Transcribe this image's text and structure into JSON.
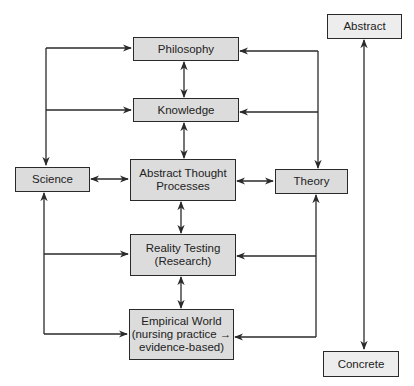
{
  "colors": {
    "box_fill": "#dcdcdc",
    "box_fill_light": "#ededed",
    "border": "#2a2a2a",
    "line": "#2a2a2a"
  },
  "nodes": {
    "philosophy": {
      "label": "Philosophy"
    },
    "knowledge": {
      "label": "Knowledge"
    },
    "abstract_thought": {
      "line1": "Abstract Thought",
      "line2": "Processes"
    },
    "reality_testing": {
      "line1": "Reality Testing",
      "line2": "(Research)"
    },
    "empirical_world": {
      "line1": "Empirical World",
      "line2": "(nursing practice →",
      "line3": "evidence-based)"
    },
    "science": {
      "label": "Science"
    },
    "theory": {
      "label": "Theory"
    },
    "abstract": {
      "label": "Abstract"
    },
    "concrete": {
      "label": "Concrete"
    }
  },
  "edges": [
    {
      "from": "philosophy",
      "to": "knowledge",
      "type": "bidirectional"
    },
    {
      "from": "knowledge",
      "to": "abstract_thought",
      "type": "bidirectional"
    },
    {
      "from": "abstract_thought",
      "to": "reality_testing",
      "type": "bidirectional"
    },
    {
      "from": "reality_testing",
      "to": "empirical_world",
      "type": "bidirectional"
    },
    {
      "from": "science",
      "to": "abstract_thought",
      "type": "bidirectional"
    },
    {
      "from": "abstract_thought",
      "to": "theory",
      "type": "bidirectional"
    },
    {
      "from": "science",
      "to": [
        "philosophy",
        "knowledge",
        "reality_testing",
        "empirical_world"
      ],
      "type": "bus"
    },
    {
      "from": "theory",
      "to": [
        "philosophy",
        "knowledge",
        "reality_testing",
        "empirical_world"
      ],
      "type": "bus"
    },
    {
      "from": "abstract",
      "to": "concrete",
      "type": "bidirectional"
    }
  ]
}
